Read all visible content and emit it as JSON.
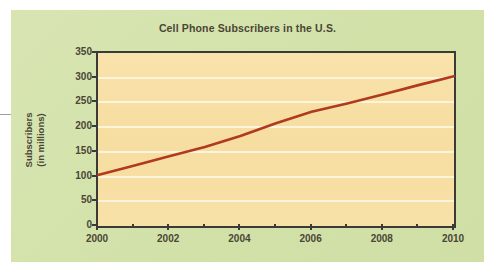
{
  "chart_data": {
    "type": "line",
    "title": "Cell Phone Subscribers in the U.S.",
    "xlabel": "",
    "ylabel": "Subscribers\n(in millions)",
    "ylabel_line1": "Subscribers",
    "ylabel_line2": "(in millions)",
    "xlim": [
      2000,
      2010
    ],
    "ylim": [
      0,
      350
    ],
    "grid": true,
    "legend": "none",
    "x_tick_labels": [
      "2000",
      "2002",
      "2004",
      "2006",
      "2008",
      "2010"
    ],
    "x_tick_values": [
      2000,
      2002,
      2004,
      2006,
      2008,
      2010
    ],
    "x_minor_ticks": [
      2001,
      2003,
      2005,
      2007,
      2009
    ],
    "y_tick_labels": [
      "0",
      "50",
      "100",
      "150",
      "200",
      "250",
      "300",
      "350"
    ],
    "y_tick_values": [
      0,
      50,
      100,
      150,
      200,
      250,
      300,
      350
    ],
    "x": [
      2000,
      2001,
      2002,
      2003,
      2004,
      2005,
      2006,
      2007,
      2008,
      2009,
      2010
    ],
    "values": [
      103,
      122,
      141,
      160,
      182,
      208,
      231,
      248,
      266,
      285,
      303
    ],
    "series": [
      {
        "name": "Cell phone subscribers",
        "color": "#b13a1e",
        "values": [
          103,
          122,
          141,
          160,
          182,
          208,
          231,
          248,
          266,
          285,
          303
        ]
      }
    ]
  },
  "colors": {
    "panel_background": "#d5e3ae",
    "plot_background": "#f7dfa4",
    "gridline": "#fdf4dc",
    "axis": "#3b3b36",
    "text": "#4a4636",
    "line": "#b13a1e",
    "page_background": "#ffffff"
  }
}
